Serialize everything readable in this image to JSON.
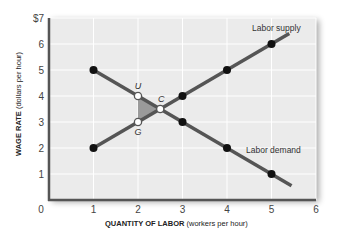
{
  "chart_data": {
    "type": "line",
    "title": "",
    "xlabel": "QUANTITY OF LABOR (workers per hour)",
    "xlabel_bold": "QUANTITY OF LABOR",
    "xlabel_unit": "(workers per hour)",
    "ylabel": "WAGE RATE (dollars per hour)",
    "ylabel_bold": "WAGE RATE",
    "ylabel_unit": "(dollars per hour)",
    "xlim": [
      0,
      6
    ],
    "ylim": [
      0,
      7
    ],
    "x_ticks": [
      "0",
      "1",
      "2",
      "3",
      "4",
      "5",
      "6"
    ],
    "y_ticks": [
      "1",
      "2",
      "3",
      "4",
      "5",
      "6",
      "$7"
    ],
    "grid": true,
    "series": [
      {
        "name": "Labor supply",
        "color": "#555555",
        "points": [
          [
            1,
            2
          ],
          [
            3,
            4
          ],
          [
            4,
            5
          ],
          [
            5,
            6
          ]
        ],
        "line_extent": [
          [
            1,
            2
          ],
          [
            5.4,
            6.4
          ]
        ]
      },
      {
        "name": "Labor demand",
        "color": "#555555",
        "points": [
          [
            1,
            5
          ],
          [
            3,
            3
          ],
          [
            4,
            2
          ],
          [
            5,
            1
          ]
        ],
        "line_extent": [
          [
            1,
            5
          ],
          [
            5.45,
            0.55
          ]
        ]
      }
    ],
    "annotations": [
      {
        "label": "U",
        "x": 2,
        "y": 4,
        "marker": "open"
      },
      {
        "label": "C",
        "x": 2.5,
        "y": 3.5,
        "marker": "open"
      },
      {
        "label": "G",
        "x": 2,
        "y": 3,
        "marker": "open"
      }
    ],
    "shaded_region": {
      "vertices": [
        [
          2,
          4
        ],
        [
          2.5,
          3.5
        ],
        [
          2,
          3
        ]
      ],
      "color": "#9a9a9a"
    }
  },
  "labels": {
    "supply": "Labor supply",
    "demand": "Labor demand",
    "origin": "0"
  }
}
